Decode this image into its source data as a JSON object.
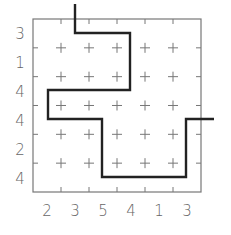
{
  "puzzle": {
    "rows": 6,
    "cols": 6,
    "row_clues": [
      "3",
      "1",
      "4",
      "4",
      "2",
      "4"
    ],
    "col_clues": [
      "2",
      "3",
      "5",
      "4",
      "1",
      "3"
    ],
    "colors": {
      "grid": "#777777",
      "path": "#222222",
      "clue": "#666666"
    }
  }
}
